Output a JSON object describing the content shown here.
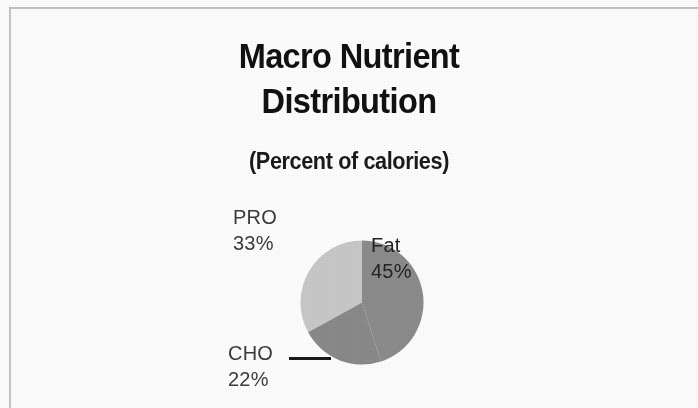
{
  "document": {
    "background_color": "#fefefe",
    "border_color": "#b9b9ba"
  },
  "chart_data": {
    "type": "pie",
    "title": "Macro Nutrient Distribution",
    "title_lines": [
      "Macro Nutrient",
      "Distribution"
    ],
    "subtitle": "(Percent of calories)",
    "xlabel": "",
    "ylabel": "",
    "unit": "%",
    "legend": "none",
    "grid": false,
    "start_angle_deg": 0,
    "direction": "clockwise",
    "categories": [
      "Fat",
      "CHO",
      "PRO"
    ],
    "values": [
      45,
      22,
      33
    ],
    "labels": [
      "45%",
      "22%",
      "33%"
    ],
    "slices": [
      {
        "name": "Fat",
        "value": 45,
        "value_label": "45%",
        "color": "#8c8c8c",
        "label_position": "inside",
        "start_deg": 0,
        "end_deg": 162
      },
      {
        "name": "CHO",
        "value": 22,
        "value_label": "22%",
        "color": "#8a8a8a",
        "label_position": "outside-lower-left",
        "start_deg": 162,
        "end_deg": 241.2,
        "has_leader_line": true
      },
      {
        "name": "PRO",
        "value": 33,
        "value_label": "33%",
        "color": "#c9c9c9",
        "label_position": "outside-upper-left",
        "start_deg": 241.2,
        "end_deg": 360
      }
    ]
  }
}
